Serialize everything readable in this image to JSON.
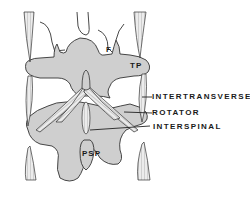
{
  "diagram": {
    "inline_labels": {
      "facet": "F",
      "transverse_process": "TP",
      "posterior_spinous_process": "PSP"
    },
    "callouts": [
      {
        "label": "INTERTRANSVERSE"
      },
      {
        "label": "ROTATOR"
      },
      {
        "label": "INTERSPINAL"
      }
    ],
    "colors": {
      "bone_fill": "#cfcfcf",
      "outline": "#333333",
      "muscle_fill": "#e6e6e6",
      "text": "#1a1a1a"
    }
  }
}
